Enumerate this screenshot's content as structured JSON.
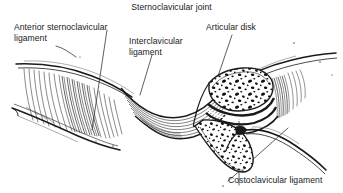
{
  "figure": {
    "title": "Sternoclavicular joint",
    "style": "pen-and-ink anatomical line drawing, black on white",
    "labels": [
      {
        "name": "anterior-sternoclavicular-ligament",
        "line1": "Anterior sternoclavicular",
        "line2": "ligament",
        "position": "upper-left"
      },
      {
        "name": "interclavicular-ligament",
        "line1": "Interclavicular",
        "line2": "ligament",
        "position": "upper-center"
      },
      {
        "name": "articular-disk",
        "line1": "Articular disk",
        "line2": "",
        "position": "upper-right"
      },
      {
        "name": "costoclavicular-ligament",
        "line1": "Costoclavicular ligament",
        "line2": "",
        "position": "bottom-right"
      }
    ],
    "colors": {
      "background": "#ffffff",
      "ink": "#1a1a1a",
      "text": "#1a1a1a",
      "shading": "#4a4a4a"
    }
  }
}
